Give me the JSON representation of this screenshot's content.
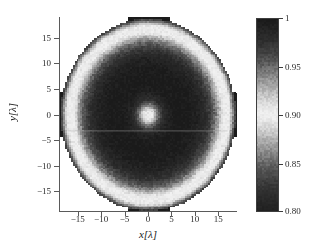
{
  "figure": {
    "background": "#ffffff",
    "axis_color": "#5a5a5a"
  },
  "axes": {
    "x_title": "x[λ]",
    "y_title": "y[λ]",
    "x_ticks": [
      "−15",
      "−10",
      "−5",
      "0",
      "5",
      "10",
      "15"
    ],
    "x_tick_values": [
      -15,
      -10,
      -5,
      0,
      5,
      10,
      15
    ],
    "y_ticks": [
      "15",
      "10",
      "5",
      "0",
      "−5",
      "−10",
      "−15"
    ],
    "y_tick_values": [
      15,
      10,
      5,
      0,
      -5,
      -10,
      -15
    ],
    "xlim": [
      -19,
      19
    ],
    "ylim": [
      -19,
      19
    ]
  },
  "colorbar": {
    "tick_labels": [
      "1",
      "0.95",
      "0.90",
      "0.85",
      "0.80"
    ],
    "tick_values": [
      1.0,
      0.95,
      0.9,
      0.85,
      0.8
    ],
    "vmin": 0.8,
    "vmax": 1.0,
    "orientation": "vertical",
    "position": "right"
  },
  "chart_data": {
    "type": "heatmap",
    "title": "",
    "xlabel": "x[λ]",
    "ylabel": "y[λ]",
    "xlim": [
      -19,
      19
    ],
    "ylim": [
      -19,
      19
    ],
    "zlim": [
      0.8,
      1.0
    ],
    "colormap": "gray_nonmonotonic",
    "colormap_description": "Grayscale where value 1.00 maps to near-black, 0.90 maps to near-white, and 0.80 maps back to near-black (band-like gray scale).",
    "colormap_stops": [
      {
        "value": 1.0,
        "color": "#1a1a1a"
      },
      {
        "value": 0.975,
        "color": "#303030"
      },
      {
        "value": 0.955,
        "color": "#555555"
      },
      {
        "value": 0.935,
        "color": "#9a9a9a"
      },
      {
        "value": 0.915,
        "color": "#d8d8d8"
      },
      {
        "value": 0.9,
        "color": "#f2f2f2"
      },
      {
        "value": 0.885,
        "color": "#d2d2d2"
      },
      {
        "value": 0.865,
        "color": "#949494"
      },
      {
        "value": 0.845,
        "color": "#585858"
      },
      {
        "value": 0.825,
        "color": "#343434"
      },
      {
        "value": 0.8,
        "color": "#202020"
      }
    ],
    "grid": false,
    "legend": "colorbar-right",
    "field_description": "Radially symmetric aperture field. Values fall from ~1.0 at the disk centre region to a light band (~0.90) forming a bright annulus near r=16, with dark lobes outside the disk along the +/-x and +/-y axes, plus a bright focal spot (~0.90) at the origin.",
    "radial_profile": {
      "r": [
        0,
        0.6,
        1.2,
        2,
        3,
        4,
        5,
        6,
        7,
        8,
        9,
        10,
        11,
        12,
        13,
        14,
        15,
        15.6,
        16.2,
        16.8,
        17.4,
        18,
        18.6
      ],
      "value": [
        0.902,
        0.906,
        0.915,
        0.945,
        0.975,
        0.988,
        0.995,
        0.998,
        0.999,
        0.998,
        0.996,
        0.993,
        0.988,
        0.98,
        0.968,
        0.952,
        0.93,
        0.912,
        0.901,
        0.898,
        0.908,
        0.935,
        0.965
      ]
    },
    "lobes": {
      "description": "Four dark lobes outside the circular support, centred on the axes",
      "centers": [
        [
          0,
          18.3
        ],
        [
          0,
          -18.3
        ],
        [
          18.3,
          0
        ],
        [
          -18.3,
          0
        ]
      ],
      "value": 1.0,
      "extent_along_axis": 2.2,
      "extent_across_axis": 4.5
    },
    "support_radius": 18.7,
    "center_spot": {
      "radius": 1.6,
      "value": 0.902
    }
  }
}
